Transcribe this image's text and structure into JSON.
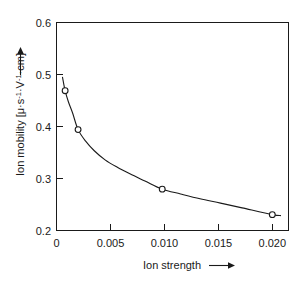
{
  "chart_data": {
    "type": "line",
    "title": "",
    "xlabel": "Ion strength",
    "ylabel": "Ion mobility [μ·s⁻¹·V⁻¹·cm]",
    "ylabel_parts": {
      "prefix": "Ion mobility [μ·s",
      "sup1": "-1",
      "mid": "·V",
      "sup2": "-1",
      "suffix": "·cm]"
    },
    "xlim": [
      0,
      0.0215
    ],
    "ylim": [
      0.168,
      0.6
    ],
    "xticks": [
      0,
      0.005,
      0.01,
      0.015,
      0.02
    ],
    "xtick_labels": [
      "0",
      "0.005",
      "0.010",
      "0.015",
      "0.020"
    ],
    "yticks": [
      0.2,
      0.3,
      0.4,
      0.5,
      0.6
    ],
    "ytick_labels": [
      "0.2",
      "0.3",
      "0.4",
      "0.5",
      "0.6"
    ],
    "grid": false,
    "legend": false,
    "marker": "open-circle",
    "series": [
      {
        "name": "Ion mobility",
        "x": [
          0.0008,
          0.002,
          0.0098,
          0.02
        ],
        "values": [
          0.458,
          0.377,
          0.253,
          0.2
        ]
      }
    ],
    "curve_points": {
      "x": [
        0.00055,
        0.0008,
        0.0011,
        0.0015,
        0.002,
        0.0027,
        0.0035,
        0.0045,
        0.0056,
        0.0068,
        0.0082,
        0.0098,
        0.0115,
        0.0133,
        0.0152,
        0.0172,
        0.02,
        0.0208
      ],
      "y": [
        0.487,
        0.458,
        0.435,
        0.411,
        0.377,
        0.353,
        0.333,
        0.314,
        0.299,
        0.285,
        0.27,
        0.253,
        0.243,
        0.233,
        0.224,
        0.214,
        0.2,
        0.198
      ]
    },
    "axis_arrows": {
      "x_arrow": "right",
      "y_arrow": "up"
    },
    "colors": {
      "axis": "#1a1a1a",
      "curve": "#1a1a1a",
      "marker_fill": "#ffffff",
      "background": "#ffffff"
    }
  }
}
